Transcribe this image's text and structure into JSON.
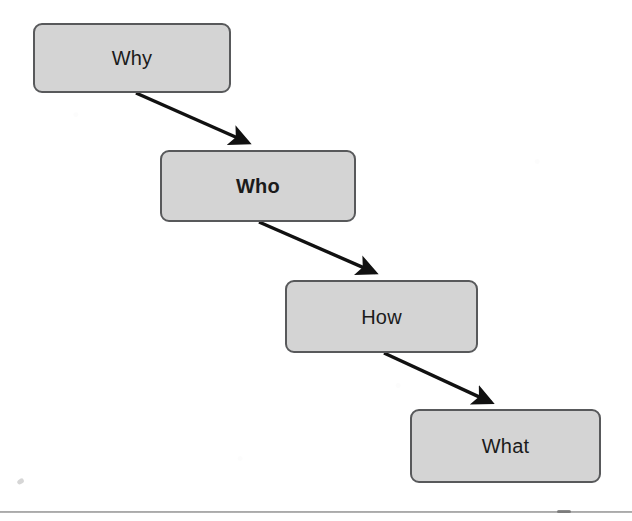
{
  "diagram": {
    "type": "flowchart-cascade",
    "background_color": "#ffffff",
    "node_fill_color": "#d4d4d4",
    "node_border_color": "#58595b",
    "arrow_color": "#111111",
    "nodes": [
      {
        "id": "why",
        "label": "Why",
        "emphasis": "regular",
        "x": 33,
        "y": 23,
        "width": 198,
        "height": 70
      },
      {
        "id": "who",
        "label": "Who",
        "emphasis": "bold",
        "x": 160,
        "y": 150,
        "width": 196,
        "height": 72
      },
      {
        "id": "how",
        "label": "How",
        "emphasis": "regular",
        "x": 285,
        "y": 280,
        "width": 193,
        "height": 73
      },
      {
        "id": "what",
        "label": "What",
        "emphasis": "regular",
        "x": 410,
        "y": 409,
        "width": 191,
        "height": 74
      }
    ],
    "edges": [
      {
        "id": "why-to-who",
        "from": "why",
        "to": "who",
        "from_point": [
          136,
          93
        ],
        "to_point": [
          258,
          147
        ],
        "arrowhead": "solid-triangle"
      },
      {
        "id": "who-to-how",
        "from": "who",
        "to": "how",
        "from_point": [
          259,
          222
        ],
        "to_point": [
          385,
          277
        ],
        "arrowhead": "solid-triangle"
      },
      {
        "id": "how-to-what",
        "from": "how",
        "to": "what",
        "from_point": [
          384,
          353
        ],
        "to_point": [
          501,
          407
        ],
        "arrowhead": "solid-triangle"
      }
    ],
    "footer_rule": {
      "y": 511,
      "color": "#9a9a9a"
    }
  }
}
